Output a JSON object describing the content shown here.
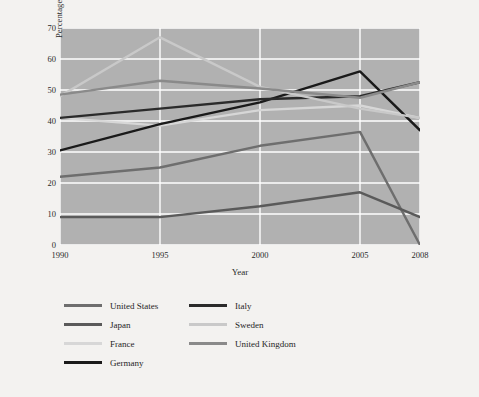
{
  "figure": {
    "background_color": "#f3f2f0",
    "plot_background_color": "#b1b1b1",
    "gridline_color": "#ffffff"
  },
  "chart_data": {
    "type": "line",
    "title": "",
    "xlabel": "Year",
    "ylabel": "Percentage of marriages that end in divorce",
    "x": [
      1990,
      1995,
      2000,
      2005,
      2008
    ],
    "xtick_labels": [
      "1990",
      "1995",
      "2000",
      "2005",
      "2008"
    ],
    "ytick_labels": [
      "0",
      "10",
      "20",
      "30",
      "40",
      "50",
      "60",
      "70"
    ],
    "ylim": [
      0,
      70
    ],
    "xlim": [
      1990,
      2008
    ],
    "grid": true,
    "legend_position": "below-plot",
    "series": [
      {
        "name": "United States",
        "color": "#6e6e6e",
        "values": [
          22,
          25,
          32,
          36.5,
          0
        ]
      },
      {
        "name": "Japan",
        "color": "#5a5a5a",
        "values": [
          9,
          9,
          12.5,
          17,
          9
        ]
      },
      {
        "name": "France",
        "color": "#d7d7d7",
        "values": [
          41,
          38.5,
          43.5,
          45,
          41
        ]
      },
      {
        "name": "Germany",
        "color": "#1a1a1a",
        "values": [
          30.5,
          39,
          46,
          56,
          37
        ]
      },
      {
        "name": "Italy",
        "color": "#2b2b2b",
        "values": [
          41,
          44,
          47,
          48,
          52.5
        ]
      },
      {
        "name": "Sweden",
        "color": "#c9c9c9",
        "values": [
          48,
          67,
          51,
          44,
          41
        ]
      },
      {
        "name": "United Kingdom",
        "color": "#8a8a8a",
        "values": [
          48.5,
          53,
          50.5,
          47.5,
          52.5
        ]
      }
    ]
  },
  "legend": {
    "columns": [
      {
        "items": [
          {
            "label": "United States",
            "color": "#6e6e6e",
            "thickness": 3.5
          },
          {
            "label": "Japan",
            "color": "#5a5a5a",
            "thickness": 3.5
          },
          {
            "label": "France",
            "color": "#d7d7d7",
            "thickness": 3.5
          },
          {
            "label": "Germany",
            "color": "#1a1a1a",
            "thickness": 3.5
          }
        ]
      },
      {
        "items": [
          {
            "label": "Italy",
            "color": "#2b2b2b",
            "thickness": 3.5
          },
          {
            "label": "Sweden",
            "color": "#c9c9c9",
            "thickness": 3.5
          },
          {
            "label": "United Kingdom",
            "color": "#8a8a8a",
            "thickness": 3.5
          }
        ]
      }
    ]
  }
}
